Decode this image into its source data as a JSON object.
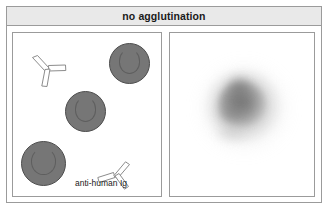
{
  "figure": {
    "title": "no agglutination",
    "background_color": "#ffffff",
    "frame_border_color": "#9b9b9b",
    "header_background": "#e9e9e9",
    "header_text_color": "#1a1a1a"
  },
  "panels": {
    "left": {
      "name": "reaction-schematic-panel",
      "description": "schematic of free red blood cells and unbound anti-human Ig antibodies",
      "cell_color": "#767676",
      "cell_outline_color": "#4d4d4d",
      "antibody_fill": "#ffffff",
      "antibody_outline": "#8c8c8c",
      "label": "anti-human Ig",
      "cells": [
        {
          "id": "rbc-1",
          "x": 96,
          "y": 10,
          "size": 41
        },
        {
          "id": "rbc-2",
          "x": 52,
          "y": 58,
          "size": 41
        },
        {
          "id": "rbc-3",
          "x": 8,
          "y": 108,
          "size": 45
        }
      ],
      "antibodies": [
        {
          "id": "antibody-1",
          "x": 18,
          "y": 22
        },
        {
          "id": "antibody-2",
          "x": 84,
          "y": 128
        }
      ]
    },
    "right": {
      "name": "test-tube-result-panel",
      "description": "diffuse smooth button of non-agglutinated cells",
      "blob_center_x": 72,
      "blob_center_y": 71,
      "blob_color": "#6e6e6e"
    }
  }
}
